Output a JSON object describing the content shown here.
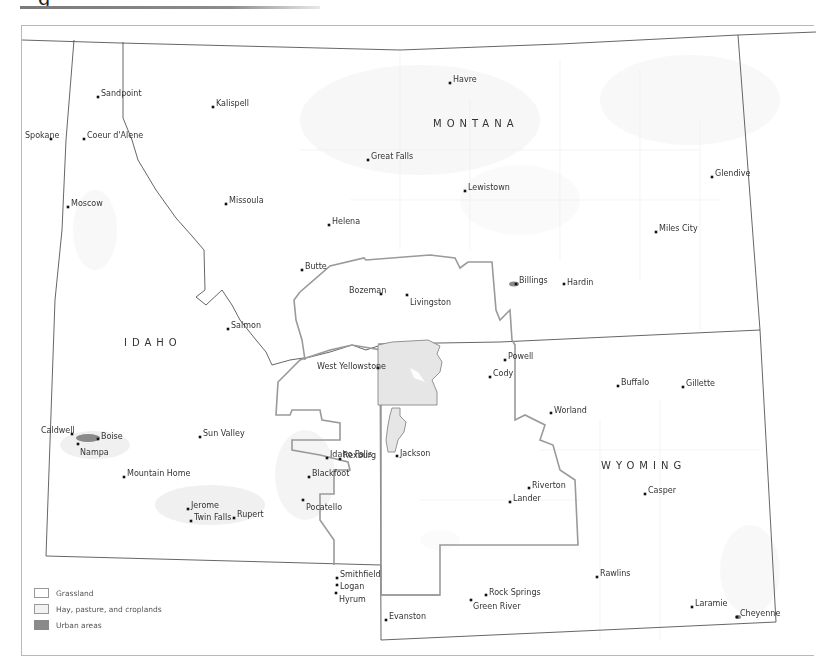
{
  "header": {
    "title_glyph": "g"
  },
  "map": {
    "states": [
      {
        "name": "MONTANA",
        "x": 433,
        "y": 127
      },
      {
        "name": "IDAHO",
        "x": 124,
        "y": 346
      },
      {
        "name": "WYOMING",
        "x": 601,
        "y": 469
      }
    ],
    "cities": [
      {
        "name": "Sandpoint",
        "x": 98,
        "y": 97,
        "lx": 101,
        "ly": 93
      },
      {
        "name": "Kalispell",
        "x": 213,
        "y": 107,
        "lx": 216,
        "ly": 103
      },
      {
        "name": "Havre",
        "x": 450,
        "y": 83,
        "lx": 453,
        "ly": 79
      },
      {
        "name": "Spokane",
        "x": 51,
        "y": 139,
        "lx": 25,
        "ly": 135
      },
      {
        "name": "Coeur d'Alene",
        "x": 84,
        "y": 139,
        "lx": 87,
        "ly": 135
      },
      {
        "name": "Great Falls",
        "x": 368,
        "y": 160,
        "lx": 371,
        "ly": 156
      },
      {
        "name": "Glendive",
        "x": 712,
        "y": 177,
        "lx": 715,
        "ly": 173
      },
      {
        "name": "Lewistown",
        "x": 465,
        "y": 191,
        "lx": 468,
        "ly": 187
      },
      {
        "name": "Moscow",
        "x": 68,
        "y": 207,
        "lx": 71,
        "ly": 203
      },
      {
        "name": "Missoula",
        "x": 226,
        "y": 204,
        "lx": 229,
        "ly": 200
      },
      {
        "name": "Helena",
        "x": 329,
        "y": 225,
        "lx": 332,
        "ly": 221
      },
      {
        "name": "Miles City",
        "x": 656,
        "y": 232,
        "lx": 659,
        "ly": 228
      },
      {
        "name": "Butte",
        "x": 302,
        "y": 270,
        "lx": 305,
        "ly": 266
      },
      {
        "name": "Billings",
        "x": 516,
        "y": 284,
        "lx": 519,
        "ly": 280
      },
      {
        "name": "Hardin",
        "x": 564,
        "y": 284,
        "lx": 567,
        "ly": 282
      },
      {
        "name": "Bozeman",
        "x": 381,
        "y": 294,
        "lx": 349,
        "ly": 290
      },
      {
        "name": "Livingston",
        "x": 407,
        "y": 295,
        "lx": 410,
        "ly": 302
      },
      {
        "name": "Salmon",
        "x": 228,
        "y": 329,
        "lx": 231,
        "ly": 325
      },
      {
        "name": "Powell",
        "x": 505,
        "y": 360,
        "lx": 508,
        "ly": 356
      },
      {
        "name": "West Yellowstone",
        "x": 378,
        "y": 368,
        "lx": 317,
        "ly": 366
      },
      {
        "name": "Cody",
        "x": 490,
        "y": 377,
        "lx": 493,
        "ly": 373
      },
      {
        "name": "Buffalo",
        "x": 618,
        "y": 386,
        "lx": 621,
        "ly": 382
      },
      {
        "name": "Gillette",
        "x": 683,
        "y": 387,
        "lx": 686,
        "ly": 383
      },
      {
        "name": "Worland",
        "x": 551,
        "y": 413,
        "lx": 554,
        "ly": 410
      },
      {
        "name": "Caldwell",
        "x": 72,
        "y": 434,
        "lx": 41,
        "ly": 430
      },
      {
        "name": "Boise",
        "x": 98,
        "y": 439,
        "lx": 101,
        "ly": 436
      },
      {
        "name": "Sun Valley",
        "x": 200,
        "y": 437,
        "lx": 203,
        "ly": 433
      },
      {
        "name": "Nampa",
        "x": 78,
        "y": 444,
        "lx": 80,
        "ly": 452
      },
      {
        "name": "Rexburg",
        "x": 340,
        "y": 459,
        "lx": 343,
        "ly": 455
      },
      {
        "name": "Idaho Falls",
        "x": 327,
        "y": 458,
        "lx": 330,
        "ly": 454
      },
      {
        "name": "Jackson",
        "x": 397,
        "y": 456,
        "lx": 400,
        "ly": 453
      },
      {
        "name": "Mountain Home",
        "x": 124,
        "y": 477,
        "lx": 127,
        "ly": 473
      },
      {
        "name": "Blackfoot",
        "x": 309,
        "y": 477,
        "lx": 312,
        "ly": 473
      },
      {
        "name": "Riverton",
        "x": 529,
        "y": 488,
        "lx": 532,
        "ly": 485
      },
      {
        "name": "Casper",
        "x": 645,
        "y": 494,
        "lx": 648,
        "ly": 490
      },
      {
        "name": "Lander",
        "x": 510,
        "y": 502,
        "lx": 513,
        "ly": 498
      },
      {
        "name": "Jerome",
        "x": 188,
        "y": 509,
        "lx": 191,
        "ly": 505
      },
      {
        "name": "Pocatello",
        "x": 303,
        "y": 500,
        "lx": 306,
        "ly": 507
      },
      {
        "name": "Rupert",
        "x": 234,
        "y": 518,
        "lx": 237,
        "ly": 514
      },
      {
        "name": "Twin Falls",
        "x": 191,
        "y": 521,
        "lx": 194,
        "ly": 517
      },
      {
        "name": "Smithfield",
        "x": 337,
        "y": 578,
        "lx": 340,
        "ly": 574
      },
      {
        "name": "Logan",
        "x": 337,
        "y": 585,
        "lx": 340,
        "ly": 586
      },
      {
        "name": "Hyrum",
        "x": 336,
        "y": 593,
        "lx": 339,
        "ly": 599
      },
      {
        "name": "Rawlins",
        "x": 597,
        "y": 577,
        "lx": 600,
        "ly": 573
      },
      {
        "name": "Rock Springs",
        "x": 486,
        "y": 595,
        "lx": 489,
        "ly": 592
      },
      {
        "name": "Green River",
        "x": 471,
        "y": 600,
        "lx": 473,
        "ly": 606
      },
      {
        "name": "Laramie",
        "x": 692,
        "y": 607,
        "lx": 695,
        "ly": 603
      },
      {
        "name": "Evanston",
        "x": 386,
        "y": 620,
        "lx": 389,
        "ly": 616
      },
      {
        "name": "Cheyenne",
        "x": 737,
        "y": 617,
        "lx": 740,
        "ly": 613
      }
    ]
  },
  "legend": {
    "items": [
      {
        "label": "Grassland",
        "color": "#ffffff"
      },
      {
        "label": "Hay, pasture, and croplands",
        "color": "#f2f2f2"
      },
      {
        "label": "Urban areas",
        "color": "#8a8a8a"
      }
    ]
  },
  "colors": {
    "state_border": "#555555",
    "ecosystem_border": "#9a9a9a",
    "yellowstone_fill": "#e6e6e6",
    "county_line": "#e8e8e8"
  }
}
